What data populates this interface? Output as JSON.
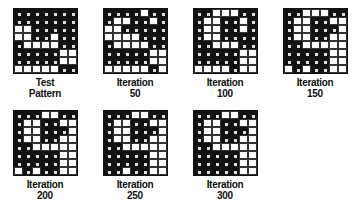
{
  "panels": [
    {
      "title": "Test",
      "subtitle": "Pattern",
      "grid": [
        "1111111",
        "1111111",
        "0011111",
        "0011011",
        "1000011",
        "1111100",
        "1111100",
        "0000011"
      ]
    },
    {
      "title": "Iteration",
      "subtitle": "50",
      "grid": [
        "1111011",
        "1001101",
        "0011111",
        "0000111",
        "1000011",
        "1111100",
        "1111100",
        "0000010"
      ]
    },
    {
      "title": "Iteration",
      "subtitle": "100",
      "grid": [
        "1100011",
        "1001101",
        "1001101",
        "1001111",
        "1100011",
        "1111100",
        "1111100",
        "0000100"
      ]
    },
    {
      "title": "Iteration",
      "subtitle": "150",
      "grid": [
        "1100011",
        "1001100",
        "1001110",
        "1001100",
        "1100000",
        "1111100",
        "1111100",
        "0101100"
      ]
    },
    {
      "title": "Iteration",
      "subtitle": "200",
      "grid": [
        "1110011",
        "1001100",
        "1001110",
        "1001100",
        "1100000",
        "1111100",
        "1111100",
        "0101100"
      ]
    },
    {
      "title": "Iteration",
      "subtitle": "250",
      "grid": [
        "1110011",
        "1001100",
        "1001110",
        "1001100",
        "1100000",
        "1111100",
        "1111100",
        "1101100"
      ]
    },
    {
      "title": "Iteration",
      "subtitle": "300",
      "grid": [
        "1110011",
        "1001100",
        "1001110",
        "1001100",
        "1100000",
        "1111100",
        "1111100",
        "1111100"
      ]
    }
  ]
}
